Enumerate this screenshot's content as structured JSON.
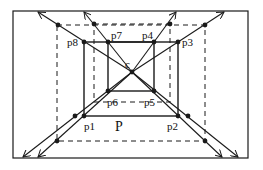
{
  "diagram": {
    "colors": {
      "stroke": "#1a1a1a",
      "background": "#ffffff"
    },
    "frame": {
      "x": 13,
      "y": 11,
      "w": 235,
      "h": 147
    },
    "center": {
      "label": "c",
      "x": 132,
      "y": 72
    },
    "solid_box_labels": {
      "p1": "p1",
      "p2": "p2",
      "p3": "p3",
      "p4": "p4",
      "p5": "p5",
      "p6": "p6",
      "p7": "p7",
      "p8": "p8",
      "polygon": "P"
    },
    "points": {
      "p1": [
        84,
        116
      ],
      "p2": [
        178,
        116
      ],
      "p3": [
        178,
        42
      ],
      "p4": [
        154,
        42
      ],
      "p5": [
        154,
        91
      ],
      "p6": [
        108,
        91
      ],
      "p7": [
        108,
        42
      ],
      "p8": [
        84,
        42
      ]
    },
    "dashed_outer": {
      "x1": 57,
      "y1": 25,
      "x2": 205,
      "y2": 141
    },
    "dashed_inner": {
      "x1": 94,
      "y1": 24,
      "x2": 170,
      "y2": 102
    },
    "rays": [
      {
        "through": "p8",
        "end": [
          38,
          12
        ],
        "dot": [
          58,
          25
        ]
      },
      {
        "through": "p7",
        "end": [
          84,
          12
        ],
        "dot": [
          94,
          24
        ]
      },
      {
        "through": "p4",
        "end": [
          176,
          12
        ],
        "dot": [
          170,
          24
        ]
      },
      {
        "through": "p3",
        "end": [
          224,
          12
        ],
        "dot": [
          205,
          25
        ]
      },
      {
        "through": "p6",
        "end": [
          23,
          157
        ],
        "dot": [
          75,
          116
        ]
      },
      {
        "through": "p1",
        "end": [
          38,
          157
        ],
        "dot": [
          57,
          141
        ]
      },
      {
        "through": "p2",
        "end": [
          222,
          157
        ],
        "dot": [
          205,
          141
        ]
      },
      {
        "through": "p5",
        "end": [
          238,
          157
        ],
        "dot": [
          188,
          116
        ]
      }
    ]
  }
}
